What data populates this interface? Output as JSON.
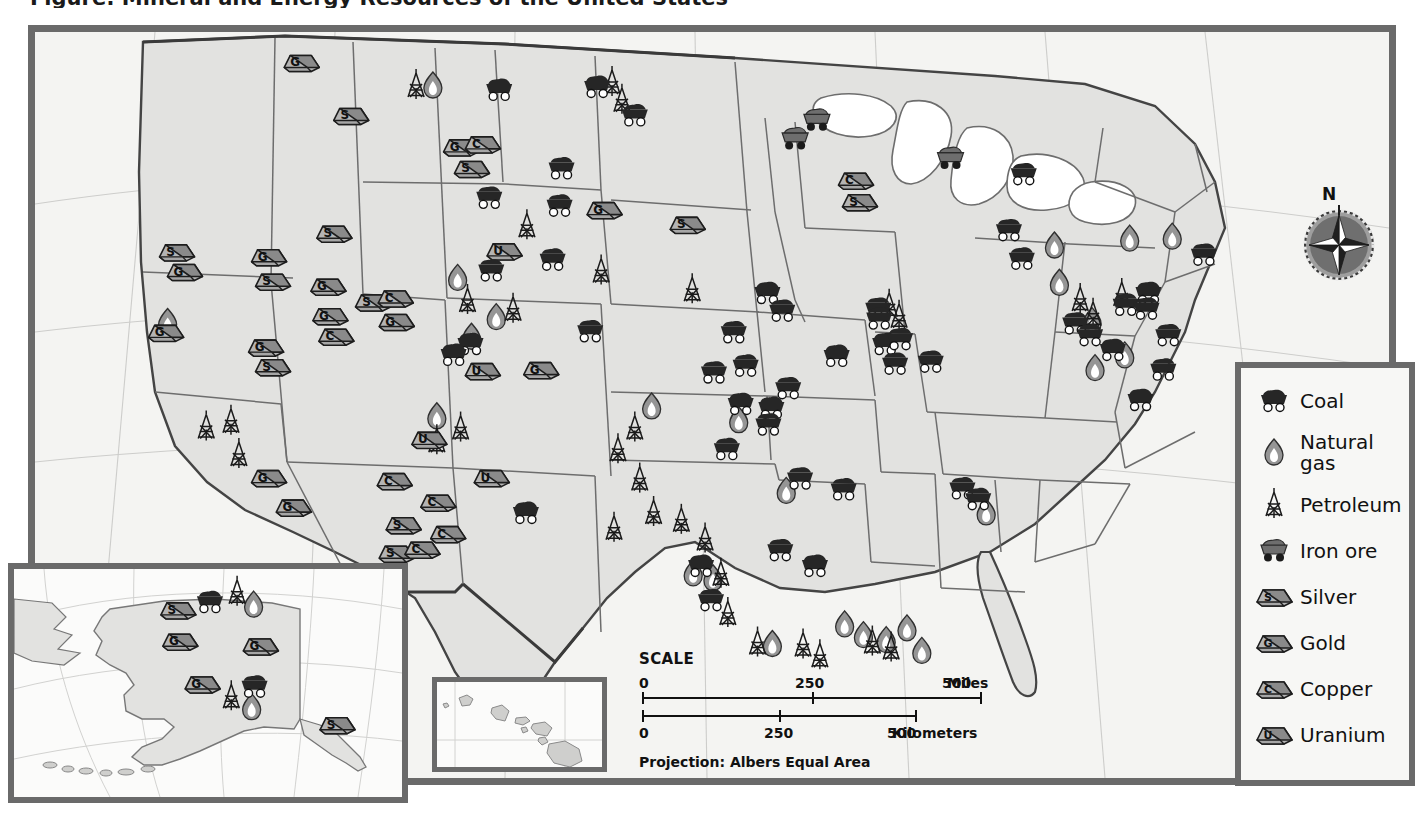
{
  "page": {
    "title": "Figure: Mineral and Energy Resources of the United States",
    "projection_label": "Projection: Albers Equal Area"
  },
  "colors": {
    "frame": "#6a6a6a",
    "land": "#e2e2e0",
    "water": "#ffffff",
    "state_border": "#6d6d6d",
    "national_border": "#3a3a3a",
    "coal_fill": "#262626",
    "iron_fill": "#6e6e6e",
    "gas_fill": "#8e8e8e",
    "petroleum_stroke": "#1a1a1a",
    "ingot_light": "#b4b4b4",
    "ingot_dark": "#8a8a8a",
    "graticule": "#c9c9c9",
    "background": "#ffffff",
    "map_background": "#f4f4f2"
  },
  "compass": {
    "north_label": "N",
    "name": "compass-rose"
  },
  "scale": {
    "title": "SCALE",
    "miles": {
      "unit": "Miles",
      "ticks": [
        "0",
        "250",
        "500"
      ]
    },
    "kilometers": {
      "unit": "Kilometers",
      "ticks": [
        "0",
        "250",
        "500"
      ]
    }
  },
  "legend": {
    "items": [
      {
        "icon": "coal-cart-icon",
        "label": "Coal"
      },
      {
        "icon": "natural-gas-flame-icon",
        "label": "Natural\ngas",
        "line1": "Natural",
        "line2": "gas"
      },
      {
        "icon": "petroleum-derrick-icon",
        "label": "Petroleum"
      },
      {
        "icon": "iron-ore-cart-icon",
        "label": "Iron ore"
      },
      {
        "icon": "silver-ingot-icon",
        "label": "Silver",
        "ingot_letter": "S"
      },
      {
        "icon": "gold-ingot-icon",
        "label": "Gold",
        "ingot_letter": "G"
      },
      {
        "icon": "copper-ingot-icon",
        "label": "Copper",
        "ingot_letter": "C"
      },
      {
        "icon": "uranium-ingot-icon",
        "label": "Uranium",
        "ingot_letter": "U"
      }
    ]
  },
  "insets": [
    {
      "name": "alaska-inset",
      "region": "Alaska"
    },
    {
      "name": "hawaii-inset",
      "region": "Hawaii"
    }
  ],
  "map_symbols": {
    "coal": [
      [
        476,
        68
      ],
      [
        575,
        65
      ],
      [
        613,
        94
      ],
      [
        539,
        148
      ],
      [
        466,
        178
      ],
      [
        537,
        186
      ],
      [
        530,
        241
      ],
      [
        468,
        252
      ],
      [
        447,
        327
      ],
      [
        430,
        338
      ],
      [
        503,
        499
      ],
      [
        568,
        314
      ],
      [
        747,
        275
      ],
      [
        762,
        293
      ],
      [
        713,
        315
      ],
      [
        725,
        349
      ],
      [
        693,
        356
      ],
      [
        720,
        388
      ],
      [
        751,
        392
      ],
      [
        748,
        409
      ],
      [
        706,
        434
      ],
      [
        768,
        372
      ],
      [
        817,
        339
      ],
      [
        824,
        475
      ],
      [
        780,
        464
      ],
      [
        760,
        537
      ],
      [
        795,
        553
      ],
      [
        680,
        553
      ],
      [
        690,
        588
      ],
      [
        859,
        291
      ],
      [
        860,
        301
      ],
      [
        866,
        327
      ],
      [
        881,
        322
      ],
      [
        876,
        347
      ],
      [
        912,
        345
      ],
      [
        944,
        474
      ],
      [
        960,
        485
      ],
      [
        991,
        211
      ],
      [
        1004,
        240
      ],
      [
        1058,
        306
      ],
      [
        1073,
        318
      ],
      [
        1096,
        333
      ],
      [
        1109,
        287
      ],
      [
        1132,
        275
      ],
      [
        1130,
        291
      ],
      [
        1152,
        318
      ],
      [
        1147,
        353
      ],
      [
        1124,
        384
      ],
      [
        1188,
        236
      ],
      [
        1006,
        154
      ]
    ],
    "iron_ore": [
      [
        775,
        118
      ],
      [
        797,
        99
      ],
      [
        932,
        138
      ]
    ],
    "natural_gas": [
      [
        409,
        62
      ],
      [
        434,
        258
      ],
      [
        448,
        318
      ],
      [
        413,
        399
      ],
      [
        473,
        298
      ],
      [
        630,
        389
      ],
      [
        718,
        403
      ],
      [
        766,
        475
      ],
      [
        672,
        559
      ],
      [
        692,
        564
      ],
      [
        752,
        631
      ],
      [
        825,
        611
      ],
      [
        844,
        622
      ],
      [
        867,
        627
      ],
      [
        888,
        615
      ],
      [
        903,
        638
      ],
      [
        968,
        497
      ],
      [
        1037,
        225
      ],
      [
        1042,
        263
      ],
      [
        1075,
        302
      ],
      [
        1078,
        350
      ],
      [
        1113,
        218
      ],
      [
        1108,
        337
      ],
      [
        1156,
        216
      ],
      [
        141,
        303
      ]
    ],
    "petroleum": [
      [
        590,
        59
      ],
      [
        600,
        77
      ],
      [
        392,
        62
      ],
      [
        504,
        205
      ],
      [
        579,
        251
      ],
      [
        671,
        270
      ],
      [
        444,
        281
      ],
      [
        490,
        290
      ],
      [
        413,
        424
      ],
      [
        437,
        411
      ],
      [
        613,
        411
      ],
      [
        596,
        433
      ],
      [
        618,
        463
      ],
      [
        632,
        497
      ],
      [
        592,
        513
      ],
      [
        660,
        505
      ],
      [
        684,
        524
      ],
      [
        700,
        560
      ],
      [
        707,
        600
      ],
      [
        737,
        630
      ],
      [
        783,
        632
      ],
      [
        800,
        643
      ],
      [
        853,
        629
      ],
      [
        872,
        635
      ],
      [
        870,
        286
      ],
      [
        880,
        297
      ],
      [
        1063,
        280
      ],
      [
        1076,
        295
      ],
      [
        1105,
        275
      ],
      [
        180,
        410
      ],
      [
        205,
        404
      ],
      [
        213,
        438
      ]
    ],
    "ingots": [
      {
        "letter": "G",
        "x": 276,
        "y": 38
      },
      {
        "letter": "S",
        "x": 326,
        "y": 92
      },
      {
        "letter": "G",
        "x": 437,
        "y": 124
      },
      {
        "letter": "C",
        "x": 459,
        "y": 121
      },
      {
        "letter": "S",
        "x": 448,
        "y": 146
      },
      {
        "letter": "S",
        "x": 666,
        "y": 203
      },
      {
        "letter": "S",
        "x": 309,
        "y": 212
      },
      {
        "letter": "G",
        "x": 582,
        "y": 188
      },
      {
        "letter": "S",
        "x": 150,
        "y": 231
      },
      {
        "letter": "G",
        "x": 158,
        "y": 251
      },
      {
        "letter": "G",
        "x": 243,
        "y": 236
      },
      {
        "letter": "S",
        "x": 247,
        "y": 261
      },
      {
        "letter": "G",
        "x": 303,
        "y": 266
      },
      {
        "letter": "S",
        "x": 348,
        "y": 282
      },
      {
        "letter": "C",
        "x": 371,
        "y": 278
      },
      {
        "letter": "G",
        "x": 305,
        "y": 296
      },
      {
        "letter": "C",
        "x": 311,
        "y": 317
      },
      {
        "letter": "G",
        "x": 372,
        "y": 302
      },
      {
        "letter": "G",
        "x": 139,
        "y": 313
      },
      {
        "letter": "G",
        "x": 240,
        "y": 328
      },
      {
        "letter": "S",
        "x": 247,
        "y": 348
      },
      {
        "letter": "G",
        "x": 243,
        "y": 461
      },
      {
        "letter": "G",
        "x": 268,
        "y": 491
      },
      {
        "letter": "U",
        "x": 481,
        "y": 230
      },
      {
        "letter": "U",
        "x": 459,
        "y": 352
      },
      {
        "letter": "G",
        "x": 518,
        "y": 351
      },
      {
        "letter": "U",
        "x": 405,
        "y": 422
      },
      {
        "letter": "U",
        "x": 468,
        "y": 461
      },
      {
        "letter": "C",
        "x": 370,
        "y": 464
      },
      {
        "letter": "C",
        "x": 414,
        "y": 486
      },
      {
        "letter": "S",
        "x": 379,
        "y": 509
      },
      {
        "letter": "C",
        "x": 424,
        "y": 518
      },
      {
        "letter": "S",
        "x": 372,
        "y": 538
      },
      {
        "letter": "C",
        "x": 398,
        "y": 534
      },
      {
        "letter": "C",
        "x": 836,
        "y": 158
      },
      {
        "letter": "S",
        "x": 840,
        "y": 180
      }
    ]
  },
  "alaska_symbols": {
    "ingots": [
      {
        "letter": "S",
        "x": 183,
        "y": 612
      },
      {
        "letter": "G",
        "x": 185,
        "y": 645
      },
      {
        "letter": "G",
        "x": 268,
        "y": 650
      },
      {
        "letter": "G",
        "x": 208,
        "y": 690
      },
      {
        "letter": "S",
        "x": 347,
        "y": 733
      }
    ],
    "coal": [
      [
        216,
        606
      ],
      [
        262,
        695
      ]
    ],
    "petroleum": [
      [
        244,
        594
      ],
      [
        238,
        704
      ]
    ],
    "natural_gas": [
      [
        261,
        607
      ],
      [
        259,
        715
      ]
    ]
  }
}
